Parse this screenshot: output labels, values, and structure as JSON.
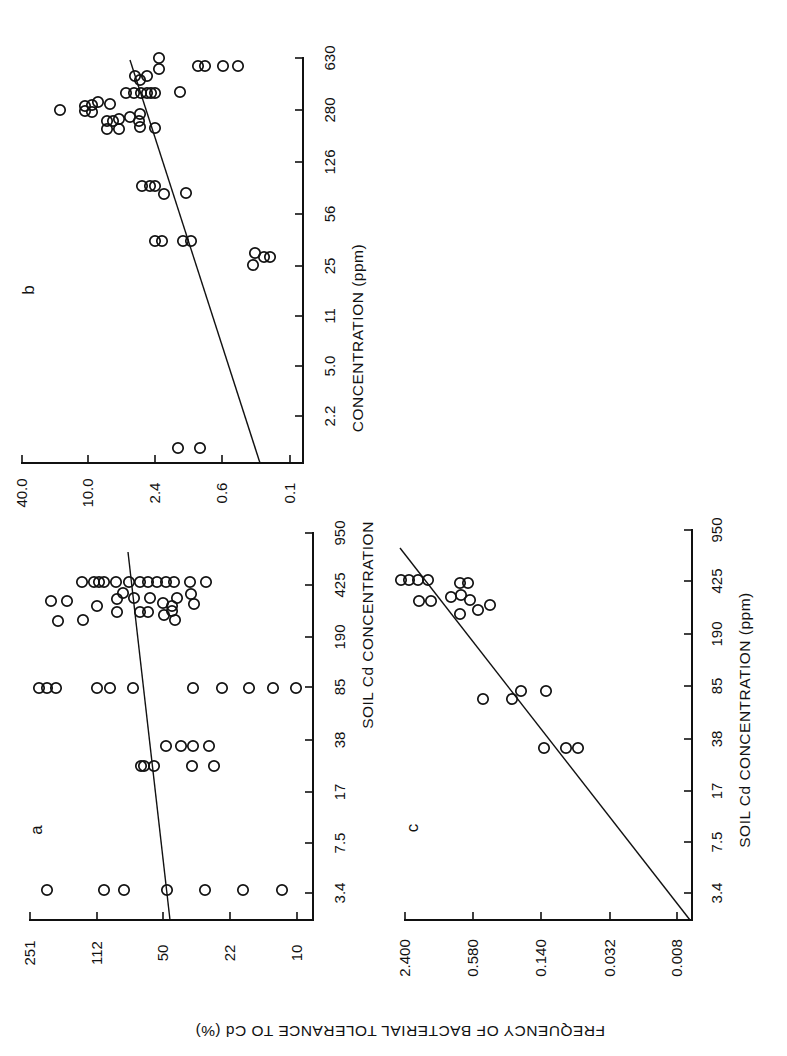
{
  "figure": {
    "y_axis_title": "FREQUENCY OF BACTERIAL TOLERANCE TO Cd (%)",
    "orientation_note": "figure printed sideways (rotated 90°)"
  },
  "chart_data": [
    {
      "panel": "a",
      "type": "scatter",
      "title": "a",
      "xlabel": "SOIL Cd CONCENTRATION (ppm)",
      "ylabel": "FREQUENCY OF BACTERIAL TOLERANCE TO Cd (%)",
      "x_scale": "log",
      "y_scale": "log",
      "x_ticks": [
        "3.4",
        "7.5",
        "17",
        "38",
        "85",
        "190",
        "425",
        "950"
      ],
      "y_ticks": [
        "251",
        "112",
        "50",
        "22",
        "10"
      ],
      "regression": {
        "x": [
          1.6,
          700
        ],
        "y": [
          46,
          80
        ]
      },
      "points": [
        {
          "x": 1.6,
          "y": 160
        },
        {
          "x": 1.6,
          "y": 110
        },
        {
          "x": 1.6,
          "y": 85
        },
        {
          "x": 1.6,
          "y": 50
        },
        {
          "x": 1.6,
          "y": 31
        },
        {
          "x": 1.6,
          "y": 18
        },
        {
          "x": 1.6,
          "y": 12
        },
        {
          "x": 27,
          "y": 62
        },
        {
          "x": 27,
          "y": 50
        },
        {
          "x": 27,
          "y": 46
        },
        {
          "x": 27,
          "y": 44
        },
        {
          "x": 27,
          "y": 42
        },
        {
          "x": 38,
          "y": 70
        },
        {
          "x": 38,
          "y": 68
        },
        {
          "x": 38,
          "y": 50
        },
        {
          "x": 38,
          "y": 40
        },
        {
          "x": 85,
          "y": 235
        },
        {
          "x": 85,
          "y": 200
        },
        {
          "x": 85,
          "y": 185
        },
        {
          "x": 85,
          "y": 112
        },
        {
          "x": 85,
          "y": 100
        },
        {
          "x": 85,
          "y": 72
        },
        {
          "x": 85,
          "y": 38
        },
        {
          "x": 85,
          "y": 25
        },
        {
          "x": 85,
          "y": 17
        },
        {
          "x": 85,
          "y": 13
        },
        {
          "x": 85,
          "y": 10
        },
        {
          "x": 240,
          "y": 150
        },
        {
          "x": 240,
          "y": 140
        },
        {
          "x": 240,
          "y": 80
        },
        {
          "x": 240,
          "y": 54
        },
        {
          "x": 240,
          "y": 50
        },
        {
          "x": 240,
          "y": 46
        },
        {
          "x": 290,
          "y": 190
        },
        {
          "x": 290,
          "y": 120
        },
        {
          "x": 290,
          "y": 110
        },
        {
          "x": 290,
          "y": 92
        },
        {
          "x": 290,
          "y": 68
        },
        {
          "x": 290,
          "y": 55
        },
        {
          "x": 290,
          "y": 47
        },
        {
          "x": 290,
          "y": 37
        },
        {
          "x": 350,
          "y": 100
        },
        {
          "x": 350,
          "y": 88
        },
        {
          "x": 350,
          "y": 80
        },
        {
          "x": 350,
          "y": 72
        },
        {
          "x": 350,
          "y": 60
        },
        {
          "x": 350,
          "y": 50
        },
        {
          "x": 350,
          "y": 40
        },
        {
          "x": 425,
          "y": 160
        },
        {
          "x": 425,
          "y": 120
        },
        {
          "x": 425,
          "y": 108
        },
        {
          "x": 425,
          "y": 80
        },
        {
          "x": 425,
          "y": 70
        },
        {
          "x": 425,
          "y": 62
        },
        {
          "x": 425,
          "y": 56
        },
        {
          "x": 425,
          "y": 52
        },
        {
          "x": 425,
          "y": 46
        },
        {
          "x": 425,
          "y": 40
        },
        {
          "x": 425,
          "y": 37
        },
        {
          "x": 425,
          "y": 35
        },
        {
          "x": 425,
          "y": 28
        }
      ]
    },
    {
      "panel": "b",
      "type": "scatter",
      "title": "b",
      "xlabel": "SOIL Cd CONCENTRATION (ppm)",
      "ylabel": "FREQUENCY OF BACTERIAL TOLERANCE TO Cd (%)",
      "x_scale": "log",
      "y_scale": "log",
      "x_ticks": [
        "2.2",
        "5.0",
        "11",
        "25",
        "56",
        "126",
        "280",
        "630"
      ],
      "y_ticks": [
        "40.0",
        "10.0",
        "2.4",
        "0.6",
        "0.1"
      ],
      "regression": {
        "x": [
          1.0,
          420
        ],
        "y": [
          0.25,
          3.2
        ]
      },
      "points": [
        {
          "x": 1.3,
          "y": 2.4
        },
        {
          "x": 1.3,
          "y": 1.4
        },
        {
          "x": 23,
          "y": 0.18
        },
        {
          "x": 26,
          "y": 0.2
        },
        {
          "x": 26,
          "y": 0.16
        },
        {
          "x": 27,
          "y": 0.15
        },
        {
          "x": 36,
          "y": 2.4
        },
        {
          "x": 36,
          "y": 2.2
        },
        {
          "x": 36,
          "y": 1.2
        },
        {
          "x": 36,
          "y": 1.1
        },
        {
          "x": 85,
          "y": 3.5
        },
        {
          "x": 85,
          "y": 3.2
        },
        {
          "x": 85,
          "y": 3.0
        },
        {
          "x": 80,
          "y": 2.0
        },
        {
          "x": 80,
          "y": 1.2
        },
        {
          "x": 180,
          "y": 7.0
        },
        {
          "x": 180,
          "y": 6.5
        },
        {
          "x": 200,
          "y": 6.0
        },
        {
          "x": 200,
          "y": 5.5
        },
        {
          "x": 230,
          "y": 4.0
        },
        {
          "x": 230,
          "y": 3.5
        },
        {
          "x": 260,
          "y": 2.5
        },
        {
          "x": 280,
          "y": 20.0
        },
        {
          "x": 280,
          "y": 11.0
        },
        {
          "x": 280,
          "y": 10.0
        },
        {
          "x": 310,
          "y": 10.5
        },
        {
          "x": 310,
          "y": 9.0
        },
        {
          "x": 310,
          "y": 7.0
        },
        {
          "x": 400,
          "y": 3.5
        },
        {
          "x": 400,
          "y": 3.0
        },
        {
          "x": 400,
          "y": 1.5
        },
        {
          "x": 500,
          "y": 4.0
        },
        {
          "x": 500,
          "y": 3.6
        },
        {
          "x": 500,
          "y": 3.3
        },
        {
          "x": 500,
          "y": 3.0
        },
        {
          "x": 500,
          "y": 2.8
        },
        {
          "x": 580,
          "y": 3.5
        },
        {
          "x": 580,
          "y": 3.2
        },
        {
          "x": 580,
          "y": 2.5
        },
        {
          "x": 580,
          "y": 0.9
        },
        {
          "x": 580,
          "y": 0.8
        },
        {
          "x": 580,
          "y": 0.6
        },
        {
          "x": 580,
          "y": 0.45
        },
        {
          "x": 650,
          "y": 2.4
        }
      ]
    },
    {
      "panel": "c",
      "type": "scatter",
      "title": "c",
      "xlabel": "SOIL Cd CONCENTRATION (ppm)",
      "ylabel": "FREQUENCY OF BACTERIAL TOLERANCE TO Cd (%)",
      "x_scale": "log",
      "y_scale": "log",
      "x_ticks": [
        "3.4",
        "7.5",
        "17",
        "38",
        "85",
        "190",
        "425",
        "950"
      ],
      "y_ticks": [
        "2.400",
        "0.580",
        "0.140",
        "0.032",
        "0.008"
      ],
      "regression": {
        "x": [
          1.6,
          750
        ],
        "y": [
          0.007,
          2.5
        ]
      },
      "points": [
        {
          "x": 33,
          "y": 0.14
        },
        {
          "x": 33,
          "y": 0.09
        },
        {
          "x": 33,
          "y": 0.08
        },
        {
          "x": 75,
          "y": 0.48
        },
        {
          "x": 75,
          "y": 0.22
        },
        {
          "x": 85,
          "y": 0.2
        },
        {
          "x": 85,
          "y": 0.12
        },
        {
          "x": 290,
          "y": 2.2
        },
        {
          "x": 290,
          "y": 1.6
        },
        {
          "x": 290,
          "y": 1.0
        },
        {
          "x": 330,
          "y": 0.9
        },
        {
          "x": 330,
          "y": 0.7
        },
        {
          "x": 330,
          "y": 0.55
        },
        {
          "x": 300,
          "y": 0.48
        },
        {
          "x": 425,
          "y": 2.4
        },
        {
          "x": 425,
          "y": 2.2
        },
        {
          "x": 425,
          "y": 2.0
        },
        {
          "x": 425,
          "y": 1.8
        },
        {
          "x": 400,
          "y": 0.6
        },
        {
          "x": 400,
          "y": 0.55
        }
      ]
    }
  ],
  "panels": {
    "a": {
      "label": "a",
      "x_title": "SOIL Cd CONCENTRATION",
      "x_ticks": [
        "950",
        "425",
        "190",
        "85",
        "38",
        "17",
        "7.5",
        "3.4"
      ],
      "y_ticks": [
        "251",
        "112",
        "50",
        "22",
        "10"
      ],
      "circles": [
        [
          47,
          890
        ],
        [
          104,
          890
        ],
        [
          124,
          890
        ],
        [
          167,
          890
        ],
        [
          205,
          890
        ],
        [
          243,
          890
        ],
        [
          282,
          890
        ],
        [
          141,
          766
        ],
        [
          144,
          766
        ],
        [
          166,
          746
        ],
        [
          193,
          746
        ],
        [
          192,
          766
        ],
        [
          214,
          766
        ],
        [
          209,
          746
        ],
        [
          181,
          746
        ],
        [
          154,
          766
        ],
        [
          39,
          688
        ],
        [
          47,
          688
        ],
        [
          56,
          688
        ],
        [
          97,
          688
        ],
        [
          110,
          688
        ],
        [
          133,
          688
        ],
        [
          193,
          688
        ],
        [
          222,
          688
        ],
        [
          249,
          688
        ],
        [
          273,
          688
        ],
        [
          296,
          688
        ],
        [
          104,
          582
        ],
        [
          94,
          582
        ],
        [
          51,
          601
        ],
        [
          67,
          601
        ],
        [
          97,
          606
        ],
        [
          140,
          612
        ],
        [
          148,
          612
        ],
        [
          83,
          620
        ],
        [
          58,
          621
        ],
        [
          117,
          612
        ],
        [
          117,
          599
        ],
        [
          123,
          593
        ],
        [
          134,
          598
        ],
        [
          150,
          598
        ],
        [
          163,
          603
        ],
        [
          172,
          606
        ],
        [
          177,
          598
        ],
        [
          164,
          615
        ],
        [
          172,
          611
        ],
        [
          175,
          620
        ],
        [
          191,
          594
        ],
        [
          194,
          604
        ],
        [
          82,
          582
        ],
        [
          99,
          582
        ],
        [
          116,
          582
        ],
        [
          129,
          582
        ],
        [
          140,
          582
        ],
        [
          148,
          582
        ],
        [
          157,
          582
        ],
        [
          166,
          582
        ],
        [
          174,
          582
        ],
        [
          190,
          582
        ],
        [
          206,
          582
        ]
      ],
      "reg": [
        [
          170,
          920
        ],
        [
          128,
          552
        ]
      ],
      "label_pos": [
        36,
        830
      ]
    },
    "b": {
      "label": "b",
      "x_title": "CONCENTRATION (ppm)",
      "x_ticks": [
        "630",
        "280",
        "126",
        "56",
        "25",
        "11",
        "5.0",
        "2.2"
      ],
      "y_ticks": [
        "40.0",
        "10.0",
        "2.4",
        "0.6",
        "0.1"
      ],
      "circles": [
        [
          178,
          448
        ],
        [
          200,
          448
        ],
        [
          255,
          253
        ],
        [
          253,
          265
        ],
        [
          264,
          257
        ],
        [
          270,
          257
        ],
        [
          155,
          241
        ],
        [
          162,
          241
        ],
        [
          183,
          241
        ],
        [
          191,
          241
        ],
        [
          142,
          186
        ],
        [
          150,
          186
        ],
        [
          155,
          186
        ],
        [
          164,
          194
        ],
        [
          186,
          193
        ],
        [
          60,
          110
        ],
        [
          85,
          106
        ],
        [
          92,
          105
        ],
        [
          98,
          102
        ],
        [
          85,
          111
        ],
        [
          92,
          112
        ],
        [
          110,
          104
        ],
        [
          107,
          121
        ],
        [
          113,
          121
        ],
        [
          107,
          129
        ],
        [
          119,
          129
        ],
        [
          119,
          119
        ],
        [
          130,
          117
        ],
        [
          140,
          114
        ],
        [
          139,
          121
        ],
        [
          140,
          127
        ],
        [
          155,
          128
        ],
        [
          126,
          93
        ],
        [
          134,
          93
        ],
        [
          141,
          93
        ],
        [
          147,
          93
        ],
        [
          155,
          93
        ],
        [
          140,
          80
        ],
        [
          151,
          93
        ],
        [
          135,
          76
        ],
        [
          147,
          76
        ],
        [
          159,
          58
        ],
        [
          159,
          69
        ],
        [
          198,
          66
        ],
        [
          205,
          66
        ],
        [
          223,
          66
        ],
        [
          238,
          66
        ],
        [
          180,
          92
        ]
      ],
      "reg": [
        [
          260,
          463
        ],
        [
          130,
          60
        ]
      ],
      "label_pos": [
        30,
        290
      ]
    },
    "c": {
      "label": "c",
      "x_title": "SOIL Cd CONCENTRATION (ppm)",
      "x_ticks": [
        "950",
        "425",
        "190",
        "85",
        "38",
        "17",
        "7.5",
        "3.4"
      ],
      "y_ticks": [
        "2.400",
        "0.580",
        "0.140",
        "0.032",
        "0.008"
      ],
      "circles": [
        [
          401,
          580
        ],
        [
          409,
          580
        ],
        [
          418,
          580
        ],
        [
          428,
          580
        ],
        [
          419,
          601
        ],
        [
          431,
          601
        ],
        [
          451,
          597
        ],
        [
          461,
          595
        ],
        [
          460,
          583
        ],
        [
          468,
          583
        ],
        [
          470,
          600
        ],
        [
          478,
          610
        ],
        [
          490,
          605
        ],
        [
          460,
          614
        ],
        [
          483,
          699
        ],
        [
          512,
          699
        ],
        [
          521,
          691
        ],
        [
          546,
          691
        ],
        [
          544,
          748
        ],
        [
          566,
          748
        ],
        [
          578,
          748
        ]
      ],
      "reg": [
        [
          690,
          920
        ],
        [
          400,
          548
        ]
      ],
      "label_pos": [
        412,
        828
      ]
    }
  }
}
